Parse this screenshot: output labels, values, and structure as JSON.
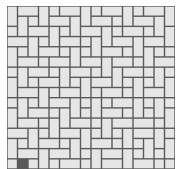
{
  "image": {
    "description": "tile paving pattern",
    "pattern": "basketweave / pinwheel rectangular tiles",
    "colors": {
      "background": "#ffffff",
      "tile_fill": "#e6e6e6",
      "grout": "#5a5a5a"
    },
    "grid": {
      "origin_x": 7,
      "origin_y": 6,
      "width": 168,
      "height": 163,
      "unit": 10.5,
      "cols": 16,
      "rows": 16
    },
    "tiles": [
      [
        0,
        0,
        1,
        2
      ],
      [
        1,
        0,
        2,
        1
      ],
      [
        3,
        0,
        1,
        2
      ],
      [
        4,
        0,
        1,
        1
      ],
      [
        5,
        0,
        2,
        1
      ],
      [
        7,
        0,
        1,
        2
      ],
      [
        8,
        0,
        1,
        1
      ],
      [
        9,
        0,
        2,
        1
      ],
      [
        11,
        0,
        1,
        2
      ],
      [
        12,
        0,
        1,
        1
      ],
      [
        13,
        0,
        2,
        1
      ],
      [
        15,
        0,
        1,
        2
      ],
      [
        1,
        1,
        1,
        2
      ],
      [
        2,
        1,
        1,
        1
      ],
      [
        4,
        1,
        2,
        1
      ],
      [
        6,
        1,
        1,
        2
      ],
      [
        8,
        1,
        2,
        1
      ],
      [
        10,
        1,
        1,
        1
      ],
      [
        12,
        1,
        2,
        1
      ],
      [
        14,
        1,
        1,
        2
      ],
      [
        0,
        2,
        1,
        1
      ],
      [
        2,
        2,
        2,
        1
      ],
      [
        4,
        2,
        1,
        2
      ],
      [
        5,
        2,
        1,
        1
      ],
      [
        7,
        2,
        2,
        1
      ],
      [
        9,
        2,
        1,
        2
      ],
      [
        10,
        2,
        1,
        1
      ],
      [
        11,
        2,
        2,
        1
      ],
      [
        13,
        2,
        1,
        1
      ],
      [
        15,
        2,
        1,
        2
      ],
      [
        0,
        3,
        2,
        1
      ],
      [
        2,
        3,
        1,
        2
      ],
      [
        3,
        3,
        1,
        1
      ],
      [
        5,
        3,
        2,
        1
      ],
      [
        7,
        3,
        1,
        1
      ],
      [
        8,
        3,
        1,
        2
      ],
      [
        10,
        3,
        2,
        1
      ],
      [
        12,
        3,
        1,
        2
      ],
      [
        13,
        3,
        2,
        1
      ],
      [
        0,
        4,
        1,
        2
      ],
      [
        1,
        4,
        1,
        1
      ],
      [
        3,
        4,
        2,
        1
      ],
      [
        5,
        4,
        1,
        1
      ],
      [
        6,
        4,
        1,
        2
      ],
      [
        7,
        4,
        1,
        1
      ],
      [
        9,
        4,
        2,
        1
      ],
      [
        11,
        4,
        1,
        1
      ],
      [
        13,
        4,
        1,
        2
      ],
      [
        14,
        4,
        1,
        1
      ],
      [
        15,
        4,
        1,
        1
      ],
      [
        1,
        5,
        2,
        1
      ],
      [
        3,
        5,
        1,
        1
      ],
      [
        4,
        5,
        2,
        1
      ],
      [
        7,
        5,
        2,
        1
      ],
      [
        9,
        5,
        1,
        2
      ],
      [
        10,
        5,
        2,
        1
      ],
      [
        12,
        5,
        1,
        1
      ],
      [
        14,
        5,
        2,
        1
      ],
      [
        0,
        6,
        1,
        1
      ],
      [
        1,
        6,
        1,
        2
      ],
      [
        2,
        6,
        2,
        1
      ],
      [
        4,
        6,
        1,
        1
      ],
      [
        5,
        6,
        1,
        2
      ],
      [
        6,
        6,
        2,
        1
      ],
      [
        8,
        6,
        1,
        1
      ],
      [
        10,
        6,
        1,
        2
      ],
      [
        11,
        6,
        2,
        1
      ],
      [
        13,
        6,
        1,
        1
      ],
      [
        14,
        6,
        1,
        2
      ],
      [
        15,
        6,
        1,
        1
      ],
      [
        0,
        7,
        1,
        2
      ],
      [
        2,
        7,
        1,
        1
      ],
      [
        3,
        7,
        2,
        1
      ],
      [
        6,
        7,
        1,
        1
      ],
      [
        7,
        7,
        1,
        2
      ],
      [
        8,
        7,
        2,
        1
      ],
      [
        11,
        7,
        1,
        1
      ],
      [
        12,
        7,
        1,
        2
      ],
      [
        13,
        7,
        1,
        1
      ],
      [
        15,
        7,
        1,
        2
      ],
      [
        1,
        8,
        2,
        1
      ],
      [
        3,
        8,
        1,
        2
      ],
      [
        4,
        8,
        1,
        1
      ],
      [
        5,
        8,
        2,
        1
      ],
      [
        8,
        8,
        1,
        1
      ],
      [
        9,
        8,
        2,
        1
      ],
      [
        11,
        8,
        1,
        1
      ],
      [
        13,
        8,
        2,
        1
      ],
      [
        0,
        9,
        1,
        1
      ],
      [
        1,
        9,
        1,
        2
      ],
      [
        2,
        9,
        1,
        1
      ],
      [
        4,
        9,
        2,
        1
      ],
      [
        6,
        9,
        1,
        2
      ],
      [
        7,
        9,
        1,
        1
      ],
      [
        8,
        9,
        1,
        2
      ],
      [
        9,
        9,
        1,
        1
      ],
      [
        10,
        9,
        2,
        1
      ],
      [
        12,
        9,
        1,
        2
      ],
      [
        13,
        9,
        1,
        1
      ],
      [
        14,
        9,
        1,
        2
      ],
      [
        15,
        9,
        1,
        1
      ],
      [
        0,
        10,
        1,
        2
      ],
      [
        2,
        10,
        2,
        1
      ],
      [
        4,
        10,
        1,
        1
      ],
      [
        5,
        10,
        1,
        2
      ],
      [
        7,
        10,
        1,
        1
      ],
      [
        9,
        10,
        2,
        1
      ],
      [
        11,
        10,
        1,
        1
      ],
      [
        13,
        10,
        1,
        1
      ],
      [
        15,
        10,
        1,
        2
      ],
      [
        1,
        11,
        2,
        1
      ],
      [
        3,
        11,
        1,
        1
      ],
      [
        4,
        11,
        1,
        2
      ],
      [
        6,
        11,
        2,
        1
      ],
      [
        8,
        11,
        1,
        1
      ],
      [
        9,
        11,
        1,
        2
      ],
      [
        10,
        11,
        2,
        1
      ],
      [
        12,
        11,
        2,
        1
      ],
      [
        14,
        11,
        1,
        1
      ],
      [
        0,
        12,
        2,
        1
      ],
      [
        2,
        12,
        1,
        2
      ],
      [
        3,
        12,
        1,
        1
      ],
      [
        5,
        12,
        2,
        1
      ],
      [
        7,
        12,
        1,
        2
      ],
      [
        8,
        12,
        1,
        1
      ],
      [
        10,
        12,
        1,
        1
      ],
      [
        11,
        12,
        1,
        2
      ],
      [
        12,
        12,
        2,
        1
      ],
      [
        14,
        12,
        1,
        2
      ],
      [
        15,
        12,
        1,
        1
      ],
      [
        0,
        13,
        1,
        2
      ],
      [
        1,
        13,
        1,
        1
      ],
      [
        3,
        13,
        2,
        1
      ],
      [
        5,
        13,
        1,
        1
      ],
      [
        6,
        13,
        1,
        2
      ],
      [
        8,
        13,
        2,
        1
      ],
      [
        10,
        13,
        1,
        1
      ],
      [
        12,
        13,
        1,
        1
      ],
      [
        13,
        13,
        1,
        2
      ],
      [
        15,
        13,
        1,
        2
      ],
      [
        1,
        14,
        2,
        1
      ],
      [
        3,
        14,
        1,
        2
      ],
      [
        4,
        14,
        2,
        1
      ],
      [
        7,
        14,
        1,
        1
      ],
      [
        8,
        14,
        1,
        2
      ],
      [
        9,
        14,
        2,
        1
      ],
      [
        11,
        14,
        1,
        2
      ],
      [
        12,
        14,
        1,
        1
      ],
      [
        14,
        14,
        1,
        1
      ],
      [
        0,
        15,
        1,
        1
      ],
      [
        2,
        15,
        1,
        1
      ],
      [
        4,
        15,
        1,
        1
      ],
      [
        5,
        15,
        2,
        1
      ],
      [
        7,
        15,
        1,
        1
      ],
      [
        9,
        15,
        2,
        1
      ],
      [
        12,
        15,
        2,
        1
      ],
      [
        14,
        15,
        1,
        1
      ],
      [
        15,
        15,
        1,
        1
      ]
    ]
  }
}
